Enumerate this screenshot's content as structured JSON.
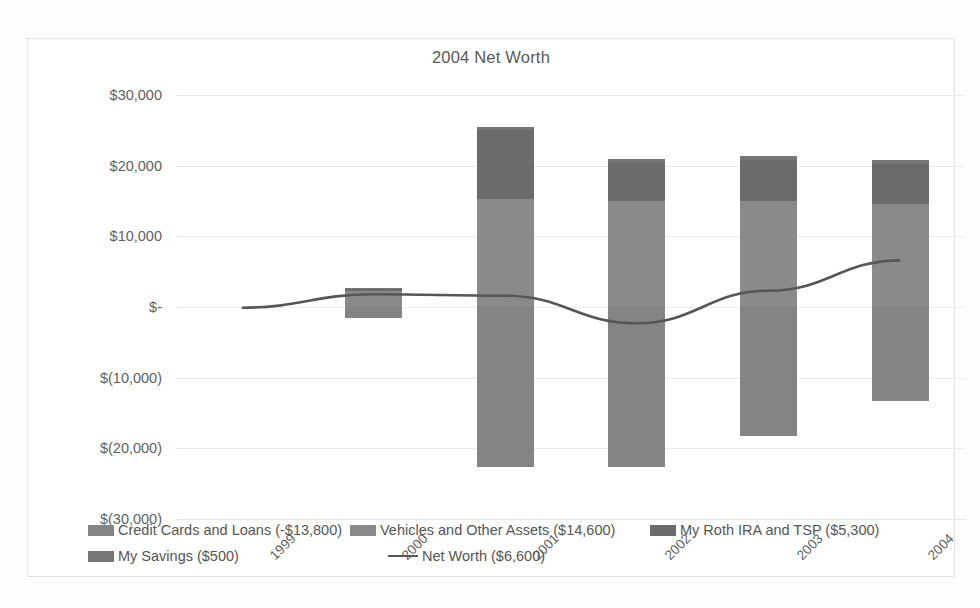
{
  "chart": {
    "title": "2004 Net Worth"
  },
  "chart_data": {
    "type": "bar",
    "subtype": "stacked-bar-with-line-overlay",
    "title": "2004 Net Worth",
    "xlabel": "",
    "ylabel": "",
    "categories": [
      "1999",
      "2000",
      "2001",
      "2002",
      "2003",
      "2004"
    ],
    "ylim": [
      -30000,
      30000
    ],
    "ytick_labels": [
      "$30,000",
      "$20,000",
      "$10,000",
      "$-",
      "$(10,000)",
      "$(20,000)",
      "$(30,000)"
    ],
    "ytick_values": [
      30000,
      20000,
      10000,
      0,
      -10000,
      -20000,
      -30000
    ],
    "grid": true,
    "legend_position": "bottom",
    "series": [
      {
        "name": "Credit Cards and Loans (-$13,800)",
        "legend_label": "Credit Cards and Loans (-$13,800)",
        "current_value": -13800,
        "color": "#848484",
        "values": [
          0,
          -1500,
          -22600,
          -22700,
          -18300,
          -13300
        ]
      },
      {
        "name": "Vehicles and Other Assets ($14,600)",
        "legend_label": "Vehicles and Other Assets ($14,600)",
        "current_value": 14600,
        "color": "#8a8a8a",
        "values": [
          0,
          2200,
          15300,
          15000,
          15000,
          14600
        ]
      },
      {
        "name": "My Roth IRA and TSP ($5,300)",
        "legend_label": "My Roth IRA and TSP ($5,300)",
        "current_value": 5300,
        "color": "#6b6b6b",
        "values": [
          0,
          300,
          9700,
          5400,
          5800,
          5700
        ]
      },
      {
        "name": "My Savings ($500)",
        "legend_label": "My Savings ($500)",
        "current_value": 500,
        "color": "#767676",
        "values": [
          0,
          200,
          500,
          500,
          500,
          500
        ]
      },
      {
        "name": "Net Worth ($6,600)",
        "legend_label": "Net Worth ($6,600)",
        "current_value": 6600,
        "type": "line",
        "color": "#565656",
        "values": [
          -100,
          1800,
          1600,
          -2300,
          2300,
          6600
        ]
      }
    ]
  }
}
